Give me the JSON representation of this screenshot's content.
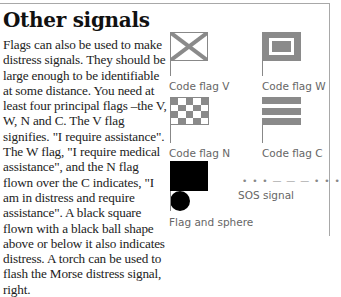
{
  "section": {
    "title": "Other signals",
    "body": "Flags can also be used to make distress signals. They should be large enough to be identifiable at some distance. You need at least four principal flags –the V, W, N and C. The V flag signifies. \"I require assistance\". The W flag, \"I require medical assistance\", and the N flag flown over the C indicates, \"I am in distress and require assistance\". A black square flown with a black ball shape above or below it also indicates distress. A torch can be used to flash the Morse distress signal, right."
  },
  "figures": {
    "flag_v": {
      "caption": "Code flag V",
      "icon": "flag-v-icon"
    },
    "flag_w": {
      "caption": "Code flag W",
      "icon": "flag-w-icon"
    },
    "flag_n": {
      "caption": "Code flag N",
      "icon": "flag-n-icon"
    },
    "flag_c": {
      "caption": "Code flag C",
      "icon": "flag-c-icon"
    },
    "flag_sphere": {
      "caption": "Flag and sphere",
      "icon": "black-flag-sphere-icon"
    },
    "sos": {
      "caption": "SOS signal",
      "pattern": "• • • — — — • • •"
    }
  },
  "colors": {
    "flag_grey": "#8a8a8a",
    "caption": "#666666",
    "rule": "#a8a8a8"
  }
}
